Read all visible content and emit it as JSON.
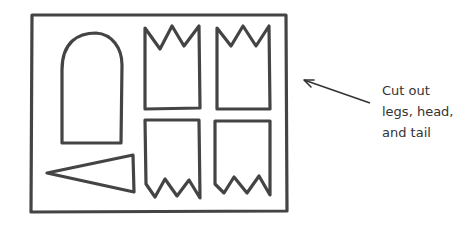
{
  "diagram": {
    "caption": {
      "lines": [
        "Cut out",
        "legs, head,",
        "and tail"
      ]
    },
    "parts": {
      "sheet": "outer-rectangle",
      "head": "arched-head",
      "legs": [
        "leg-top-left",
        "leg-top-right",
        "leg-bottom-left",
        "leg-bottom-right"
      ],
      "tail": "triangle-tail"
    },
    "colors": {
      "stroke": "#444444",
      "arrow": "#333333",
      "text": "#333333",
      "background": "#ffffff"
    }
  }
}
